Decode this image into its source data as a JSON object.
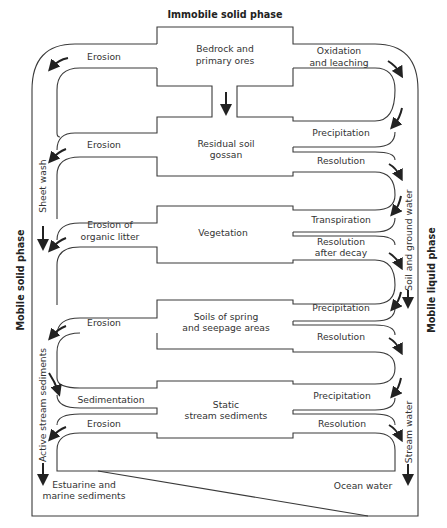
{
  "title_top": "Immobile solid phase",
  "side_left": "Mobile solid phase",
  "side_right": "Mobile liquid phase",
  "stages": [
    {
      "id": "bedrock",
      "lines": [
        "Bedrock and",
        "primary ores"
      ]
    },
    {
      "id": "residual",
      "lines": [
        "Residual soil",
        "gossan"
      ]
    },
    {
      "id": "vegetation",
      "lines": [
        "Vegetation"
      ]
    },
    {
      "id": "spring",
      "lines": [
        "Soils of spring",
        "and seepage areas"
      ]
    },
    {
      "id": "static",
      "lines": [
        "Static",
        "stream sediments"
      ]
    }
  ],
  "left_processes": [
    {
      "lines": [
        "Erosion"
      ]
    },
    {
      "lines": [
        "Erosion"
      ]
    },
    {
      "lines": [
        "Erosion of",
        "organic litter"
      ]
    },
    {
      "lines": [
        "Erosion"
      ]
    },
    {
      "lines": [
        "Sedimentation"
      ]
    },
    {
      "lines": [
        "Erosion"
      ]
    }
  ],
  "right_processes": [
    {
      "lines": [
        "Oxidation",
        "and leaching"
      ]
    },
    {
      "lines": [
        "Precipitation"
      ]
    },
    {
      "lines": [
        "Resolution"
      ]
    },
    {
      "lines": [
        "Transpiration"
      ]
    },
    {
      "lines": [
        "Resolution",
        "after decay"
      ]
    },
    {
      "lines": [
        "Precipitation"
      ]
    },
    {
      "lines": [
        "Resolution"
      ]
    },
    {
      "lines": [
        "Precipitation"
      ]
    },
    {
      "lines": [
        "Resolution"
      ]
    }
  ],
  "channels_left": [
    "Sheet wash",
    "Active stream sediments"
  ],
  "channels_right": [
    "Soil and ground water",
    "Stream water"
  ],
  "sinks": {
    "left": [
      "Estuarine and",
      "marine sediments"
    ],
    "right": [
      "Ocean water"
    ]
  }
}
